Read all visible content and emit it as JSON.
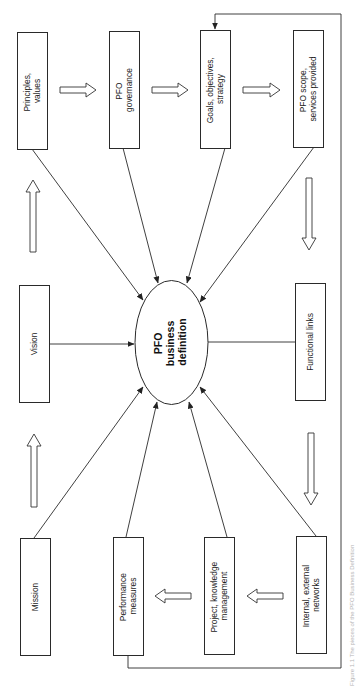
{
  "diagram": {
    "center": {
      "lines": [
        "PFO",
        "business",
        "definition"
      ]
    },
    "boxes": {
      "principles": [
        "Principles,",
        "values"
      ],
      "governance": [
        "PFO",
        "governance"
      ],
      "goals": [
        "Goals, objectives,",
        "strategy"
      ],
      "scope": [
        "PFO scope,",
        "services provided"
      ],
      "vision": [
        "Vision"
      ],
      "functional": [
        "Functional links"
      ],
      "mission": [
        "Mission"
      ],
      "performance": [
        "Performance",
        "measures"
      ],
      "project": [
        "Project, knowledge",
        "management"
      ],
      "networks": [
        "Internal, external",
        "networks"
      ]
    },
    "caption": "Figure 1.1  The pieces of the PFO Business Definition",
    "colors": {
      "stroke": "#2a2a2a",
      "background": "#ffffff"
    }
  }
}
